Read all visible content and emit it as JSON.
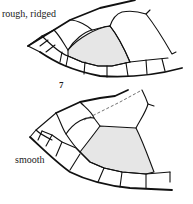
{
  "figure": {
    "panels": [
      {
        "id": "top",
        "texture_label": "rough, ridged",
        "shaded_scute": "costal"
      },
      {
        "id": "bottom",
        "texture_label": "smooth",
        "shaded_scute": "costal"
      }
    ],
    "figure_number": "7",
    "colors": {
      "line": "#111111",
      "shade": "#e6e6e6",
      "background": "#ffffff"
    }
  }
}
